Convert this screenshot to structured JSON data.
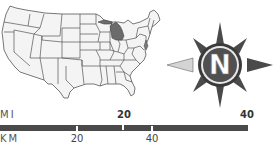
{
  "map": {
    "title": "United States map",
    "highlighted_state": "Michigan",
    "colors": {
      "land": "#f4f4f4",
      "border": "#555555",
      "highlight": "#6b6b6b"
    }
  },
  "compass": {
    "letter": "N",
    "colors": {
      "ring": "#3a3a3a",
      "inner": "#555555",
      "points": "#4a4a4a",
      "light_points": "#cfcfcf"
    }
  },
  "scale": {
    "mi_label": "MI",
    "km_label": "KM",
    "mi_ticks": [
      {
        "value": "20",
        "x": 123
      },
      {
        "value": "40",
        "x": 248
      }
    ],
    "km_ticks": [
      {
        "value": "20",
        "x": 77
      },
      {
        "value": "40",
        "x": 152
      }
    ],
    "bar_color": "#4a4a4a"
  }
}
